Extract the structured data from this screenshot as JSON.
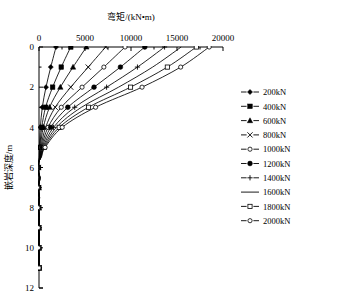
{
  "chart_data": {
    "type": "line",
    "title": "弯矩/(kN•m)",
    "xlabel": "弯矩/(kN•m)",
    "ylabel": "嵌岩深度/m",
    "xlim": [
      0,
      20000
    ],
    "ylim": [
      0,
      12
    ],
    "y_inverted": true,
    "x_axis_position": "top",
    "grid": false,
    "legend_position": "right",
    "xticks": [
      0,
      5000,
      10000,
      15000,
      20000
    ],
    "xtick_labels": [
      "0",
      "5000",
      "10000",
      "15000",
      "20000"
    ],
    "xminor_step": 2500,
    "yticks": [
      0,
      2,
      4,
      6,
      8,
      10,
      12
    ],
    "ytick_labels": [
      "0",
      "2",
      "4",
      "6",
      "8",
      "10",
      "12"
    ],
    "depths": [
      0,
      1,
      2,
      3,
      4,
      5,
      5.5,
      6,
      6.5,
      7,
      7.5,
      8,
      8.5,
      9,
      9.5,
      10,
      10.5,
      11
    ],
    "series": [
      {
        "name": "200kN",
        "marker": "filled-diamond",
        "values": [
          1850,
          1280,
          760,
          360,
          150,
          40,
          18,
          -25,
          10,
          -14,
          6,
          -10,
          4,
          -7,
          3,
          -5,
          2,
          0
        ]
      },
      {
        "name": "400kN",
        "marker": "filled-square",
        "values": [
          3450,
          2420,
          1480,
          720,
          300,
          85,
          35,
          -50,
          22,
          -28,
          12,
          -20,
          8,
          -14,
          5,
          -10,
          4,
          0
        ]
      },
      {
        "name": "600kN",
        "marker": "filled-triangle",
        "values": [
          5150,
          3700,
          2320,
          1150,
          470,
          135,
          55,
          -75,
          33,
          -42,
          18,
          -30,
          12,
          -21,
          8,
          -15,
          6,
          0
        ]
      },
      {
        "name": "800kN",
        "marker": "cross",
        "values": [
          7250,
          5350,
          3450,
          1760,
          720,
          200,
          80,
          -105,
          46,
          -58,
          25,
          -42,
          16,
          -29,
          11,
          -21,
          8,
          0
        ]
      },
      {
        "name": "1000kN",
        "marker": "open-circle",
        "values": [
          9350,
          7050,
          4680,
          2420,
          980,
          270,
          105,
          -140,
          60,
          -76,
          33,
          -55,
          21,
          -38,
          14,
          -27,
          10,
          0
        ]
      },
      {
        "name": "1200kN",
        "marker": "filled-circle",
        "values": [
          11500,
          8850,
          5980,
          3130,
          1270,
          345,
          132,
          -175,
          75,
          -95,
          41,
          -68,
          26,
          -47,
          17,
          -33,
          12,
          0
        ]
      },
      {
        "name": "1400kN",
        "marker": "plus",
        "values": [
          13650,
          10700,
          7350,
          3880,
          1580,
          425,
          160,
          -210,
          90,
          -114,
          49,
          -81,
          31,
          -56,
          20,
          -40,
          15,
          0
        ]
      },
      {
        "name": "1600kN",
        "marker": "line",
        "values": [
          15450,
          12350,
          8650,
          4620,
          1890,
          505,
          188,
          -245,
          105,
          -133,
          57,
          -94,
          36,
          -65,
          23,
          -46,
          17,
          0
        ]
      },
      {
        "name": "1800kN",
        "marker": "open-square",
        "values": [
          17100,
          13950,
          9950,
          5380,
          2200,
          585,
          215,
          -280,
          120,
          -152,
          65,
          -107,
          41,
          -74,
          27,
          -53,
          20,
          0
        ]
      },
      {
        "name": "2000kN",
        "marker": "open-diamond",
        "values": [
          18500,
          15400,
          11200,
          6150,
          2520,
          665,
          243,
          -315,
          135,
          -171,
          73,
          -120,
          46,
          -83,
          30,
          -60,
          22,
          0
        ]
      }
    ]
  },
  "legend": {
    "items": [
      {
        "label": "200kN"
      },
      {
        "label": "400kN"
      },
      {
        "label": "600kN"
      },
      {
        "label": "800kN"
      },
      {
        "label": "1000kN"
      },
      {
        "label": "1200kN"
      },
      {
        "label": "1400kN"
      },
      {
        "label": "1600kN"
      },
      {
        "label": "1800kN"
      },
      {
        "label": "2000kN"
      }
    ]
  },
  "colors": {
    "line": "#000000",
    "axis": "#000000",
    "background": "#ffffff"
  }
}
